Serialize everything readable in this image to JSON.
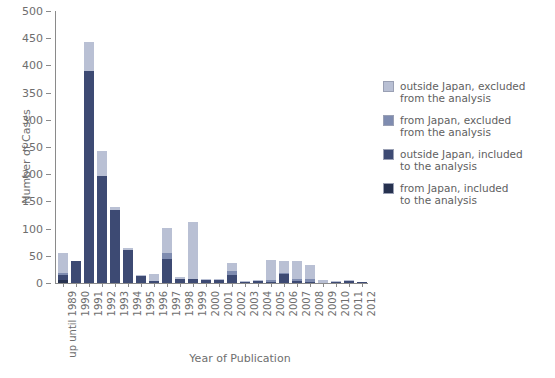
{
  "chart_data": {
    "type": "bar",
    "stacked": true,
    "title": "",
    "xlabel": "Year of Publication",
    "ylabel": "Number of Cases",
    "ylim": [
      0,
      500
    ],
    "yticks": [
      0,
      50,
      100,
      150,
      200,
      250,
      300,
      350,
      400,
      450,
      500
    ],
    "grid": false,
    "legend_position": "right",
    "categories": [
      "up until 1989",
      "1990",
      "1991",
      "1992",
      "1993",
      "1994",
      "1995",
      "1996",
      "1997",
      "1998",
      "1999",
      "2000",
      "2001",
      "2002",
      "2003",
      "2004",
      "2005",
      "2006",
      "2007",
      "2008",
      "2009",
      "2010",
      "2011",
      "2012"
    ],
    "series": [
      {
        "name": "from Japan, included to the analysis",
        "color": "#26314f",
        "values": [
          37,
          0,
          53,
          46,
          4,
          3,
          2,
          13,
          46,
          4,
          104,
          2,
          2,
          14,
          1,
          1,
          38,
          21,
          33,
          26,
          6,
          2,
          2,
          0
        ]
      },
      {
        "name": "outside Japan, included to the analysis",
        "color": "#3d4a73",
        "values": [
          4,
          0,
          0,
          0,
          0,
          0,
          0,
          0,
          11,
          0,
          0,
          0,
          0,
          8,
          0,
          0,
          3,
          2,
          4,
          5,
          0,
          0,
          0,
          0
        ]
      },
      {
        "name": "from Japan, excluded from the analysis",
        "color": "#7f8cb0",
        "values": [
          8,
          40,
          390,
          196,
          135,
          61,
          12,
          4,
          44,
          7,
          8,
          5,
          6,
          14,
          2,
          3,
          2,
          17,
          3,
          2,
          0,
          2,
          3,
          2
        ]
      },
      {
        "name": "outside Japan, excluded from the analysis",
        "color": "#b9c0d4",
        "values": [
          6,
          0,
          0,
          0,
          0,
          0,
          0,
          0,
          0,
          0,
          0,
          0,
          0,
          0,
          0,
          0,
          0,
          0,
          0,
          0,
          0,
          0,
          0,
          0
        ]
      }
    ],
    "totals": [
      55,
      40,
      443,
      242,
      139,
      64,
      14,
      17,
      101,
      11,
      112,
      7,
      8,
      36,
      3,
      4,
      43,
      40,
      40,
      33,
      6,
      4,
      5,
      2
    ]
  },
  "legend": {
    "items": [
      {
        "label_line1": "outside Japan, excluded",
        "label_line2": "from the analysis",
        "color": "#b9c0d4"
      },
      {
        "label_line1": "from Japan, excluded",
        "label_line2": "from the analysis",
        "color": "#7f8cb0"
      },
      {
        "label_line1": "outside Japan, included",
        "label_line2": "to the analysis",
        "color": "#3d4a73"
      },
      {
        "label_line1": "from Japan, included",
        "label_line2": "to the analysis",
        "color": "#26314f"
      }
    ]
  }
}
